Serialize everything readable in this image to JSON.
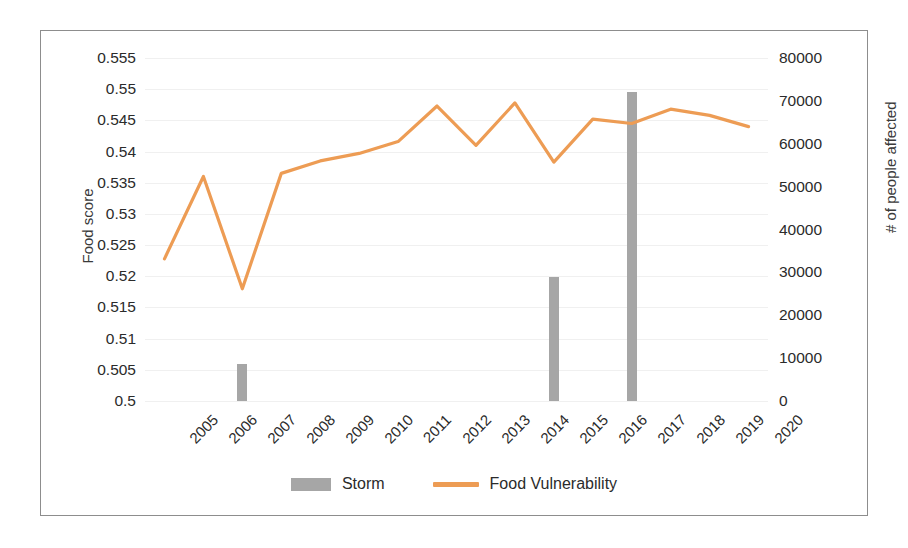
{
  "chart_data": {
    "type": "bar",
    "title": "",
    "subtitle": "",
    "xlabel": "",
    "ylabel": "Food score",
    "y2label": "# of people affected",
    "grid": true,
    "legend_position": "bottom",
    "categories": [
      "2005",
      "2006",
      "2007",
      "2008",
      "2009",
      "2010",
      "2011",
      "2012",
      "2013",
      "2014",
      "2015",
      "2016",
      "2017",
      "2018",
      "2019",
      "2020"
    ],
    "ylim": [
      0.5,
      0.555
    ],
    "yticks": [
      "0.5",
      "0.505",
      "0.51",
      "0.515",
      "0.52",
      "0.525",
      "0.53",
      "0.535",
      "0.54",
      "0.545",
      "0.55",
      "0.555"
    ],
    "ytick_values": [
      0.5,
      0.505,
      0.51,
      0.515,
      0.52,
      0.525,
      0.53,
      0.535,
      0.54,
      0.545,
      0.55,
      0.555
    ],
    "y2lim": [
      0,
      80000
    ],
    "y2ticks": [
      "0",
      "10000",
      "20000",
      "30000",
      "40000",
      "50000",
      "60000",
      "70000",
      "80000"
    ],
    "y2tick_values": [
      0,
      10000,
      20000,
      30000,
      40000,
      50000,
      60000,
      70000,
      80000
    ],
    "series": [
      {
        "name": "Storm",
        "type": "bar",
        "axis": "right",
        "color": "#a6a6a6",
        "values": [
          0,
          0,
          8600,
          0,
          0,
          0,
          0,
          0,
          0,
          0,
          29000,
          0,
          72000,
          0,
          0,
          0
        ]
      },
      {
        "name": "Food Vulnerability",
        "type": "line",
        "axis": "left",
        "color": "#ED9C54",
        "values": [
          0.5228,
          0.536,
          0.518,
          0.5365,
          0.5385,
          0.5397,
          0.5416,
          0.5473,
          0.541,
          0.5478,
          0.5383,
          0.5452,
          0.5445,
          0.5468,
          0.5458,
          0.544
        ]
      }
    ]
  },
  "legend": {
    "items": [
      {
        "label": "Storm",
        "marker": "bar-swatch",
        "color": "#a6a6a6"
      },
      {
        "label": "Food Vulnerability",
        "marker": "line-swatch",
        "color": "#ED9C54"
      }
    ]
  }
}
